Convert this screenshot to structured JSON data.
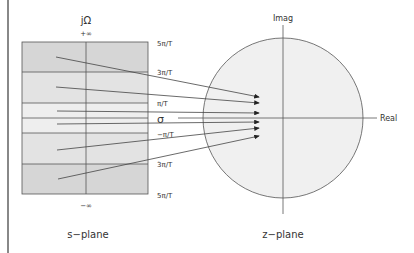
{
  "s_plane": {
    "caption": "s−plane",
    "vertical_axis_label": "jΩ",
    "horizontal_axis_label": "σ",
    "top_label": "+∞",
    "bottom_label": "−∞",
    "band_labels": [
      "5π/T",
      "3π/T",
      "π/T",
      "−π/T",
      "3π/T",
      "5π/T"
    ]
  },
  "z_plane": {
    "caption": "z−plane",
    "vertical_axis_label": "Imag",
    "horizontal_axis_label": "Real"
  },
  "colors": {
    "band_dark": "#d6d6d6",
    "band_mid": "#e3e3e3",
    "band_light": "#eeeeee",
    "circle_fill": "#f0f0f0",
    "line": "#444444",
    "left_bar": "#888888"
  }
}
